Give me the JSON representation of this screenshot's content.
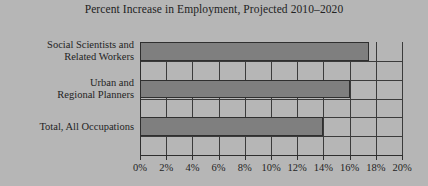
{
  "chart_data": {
    "type": "bar",
    "orientation": "horizontal",
    "title": "Percent Increase in Employment, Projected 2010–2020",
    "xlabel": "",
    "ylabel": "",
    "categories": [
      "Social Scientists and Related Workers",
      "Urban and Regional Planners",
      "Total, All Occupations"
    ],
    "category_lines": [
      [
        "Social Scientists and",
        "Related Workers"
      ],
      [
        "Urban and",
        "Regional Planners"
      ],
      [
        "Total, All Occupations"
      ]
    ],
    "values": [
      17.5,
      16,
      14
    ],
    "value_labels": [
      "17.5%",
      "16%",
      "14%"
    ],
    "xlim": [
      0,
      20
    ],
    "xticks": [
      0,
      2,
      4,
      6,
      8,
      10,
      12,
      14,
      16,
      18,
      20
    ],
    "xtick_labels": [
      "0%",
      "2%",
      "4%",
      "6%",
      "8%",
      "10%",
      "12%",
      "14%",
      "16%",
      "18%",
      "20%"
    ],
    "grid": true,
    "grid_axis": "both",
    "legend": false,
    "bar_color": "#7f7f7f",
    "bar_edge_color": "#2f2f2f",
    "grid_color": "#3b3b3b",
    "background_color": "#b6b6b6",
    "text_color": "#1f1f1f"
  }
}
